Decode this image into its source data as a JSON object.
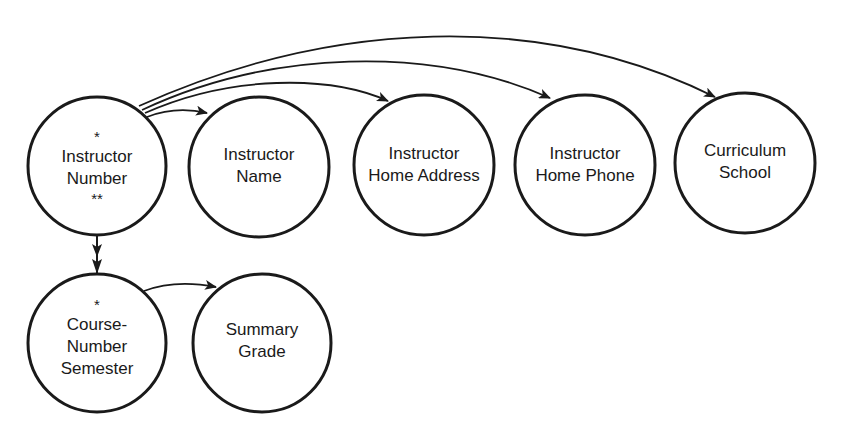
{
  "diagram": {
    "type": "functional-dependency-bubble-chart",
    "stroke_color": "#1a1a1a",
    "background": "#ffffff",
    "nodes": [
      {
        "id": "instructor_number",
        "top_mark": "*",
        "lines": [
          "Instructor",
          "Number"
        ],
        "bottom_mark": "**",
        "cx": 97,
        "cy": 166,
        "r": 69
      },
      {
        "id": "instructor_name",
        "lines": [
          "Instructor",
          "Name"
        ],
        "cx": 259,
        "cy": 167,
        "r": 70
      },
      {
        "id": "instructor_home_address",
        "lines": [
          "Instructor",
          "Home Address"
        ],
        "cx": 424,
        "cy": 165,
        "r": 70
      },
      {
        "id": "instructor_home_phone",
        "lines": [
          "Instructor",
          "Home Phone"
        ],
        "cx": 585,
        "cy": 165,
        "r": 70
      },
      {
        "id": "curriculum_school",
        "lines": [
          "Curriculum",
          "School"
        ],
        "cx": 745,
        "cy": 163,
        "r": 70
      },
      {
        "id": "course_number_semester",
        "top_mark": "*",
        "lines": [
          "Course-",
          "Number",
          "Semester"
        ],
        "cx": 97,
        "cy": 343,
        "r": 69
      },
      {
        "id": "summary_grade",
        "lines": [
          "Summary",
          "Grade"
        ],
        "cx": 262,
        "cy": 343,
        "r": 69
      }
    ],
    "edges": [
      {
        "from": "instructor_number",
        "to": "instructor_name",
        "arrow": "single"
      },
      {
        "from": "instructor_number",
        "to": "instructor_home_address",
        "arrow": "single"
      },
      {
        "from": "instructor_number",
        "to": "instructor_home_phone",
        "arrow": "single"
      },
      {
        "from": "instructor_number",
        "to": "curriculum_school",
        "arrow": "single"
      },
      {
        "from": "instructor_number",
        "to": "course_number_semester",
        "arrow": "double"
      },
      {
        "from": "course_number_semester",
        "to": "summary_grade",
        "arrow": "single"
      }
    ]
  }
}
